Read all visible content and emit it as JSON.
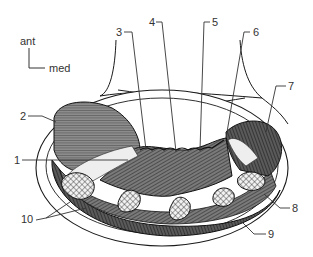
{
  "orientation": {
    "anterior_label": "ant",
    "medial_label": "med"
  },
  "labels": [
    {
      "id": "1",
      "text": "1",
      "x": 14,
      "y": 158
    },
    {
      "id": "2",
      "text": "2",
      "x": 20,
      "y": 114
    },
    {
      "id": "3",
      "text": "3",
      "x": 116,
      "y": 28
    },
    {
      "id": "4",
      "text": "4",
      "x": 148,
      "y": 18
    },
    {
      "id": "5",
      "text": "5",
      "x": 212,
      "y": 18
    },
    {
      "id": "6",
      "text": "6",
      "x": 252,
      "y": 28
    },
    {
      "id": "7",
      "text": "7",
      "x": 288,
      "y": 82
    },
    {
      "id": "8",
      "text": "8",
      "x": 292,
      "y": 204
    },
    {
      "id": "9",
      "text": "9",
      "x": 268,
      "y": 230
    },
    {
      "id": "10",
      "text": "10",
      "x": 20,
      "y": 216
    }
  ],
  "colors": {
    "ink": "#1a1a1a",
    "muscle_dark": "#3a3a3a",
    "muscle_mid": "#6e6e6e",
    "muscle_light": "#9a9a9a",
    "bone": "#f2f2f2",
    "background": "#ffffff"
  }
}
